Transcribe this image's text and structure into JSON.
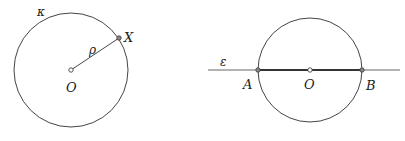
{
  "colors": {
    "stroke": "#444444",
    "text": "#222222",
    "background": "#ffffff"
  },
  "figure_left": {
    "circle_label": "κ",
    "center_label": "O",
    "radius_label": "ρ",
    "point_label": "X",
    "center": [
      71,
      70
    ],
    "radius": 57,
    "point": [
      119,
      38
    ]
  },
  "figure_right": {
    "line_label": "ε",
    "center_label": "O",
    "point_a_label": "A",
    "point_b_label": "B",
    "center": [
      310,
      70
    ],
    "radius": 52,
    "line_y": 70,
    "line_x_start": 208,
    "line_x_end": 400
  }
}
